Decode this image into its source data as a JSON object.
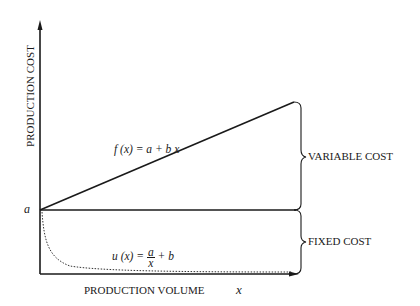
{
  "axes": {
    "y_label": "PRODUCTION COST",
    "x_label": "PRODUCTION VOLUME",
    "x_symbol": "x",
    "intercept_label": "a"
  },
  "curves": {
    "linear": {
      "lhs": "f (x) = ",
      "rhs": "a + b x"
    },
    "unit": {
      "lhs": "u (x) = ",
      "num": "a",
      "den": "x",
      "rhs": " + b"
    }
  },
  "braces": {
    "upper": "VARIABLE COST",
    "lower": "FIXED COST"
  }
}
